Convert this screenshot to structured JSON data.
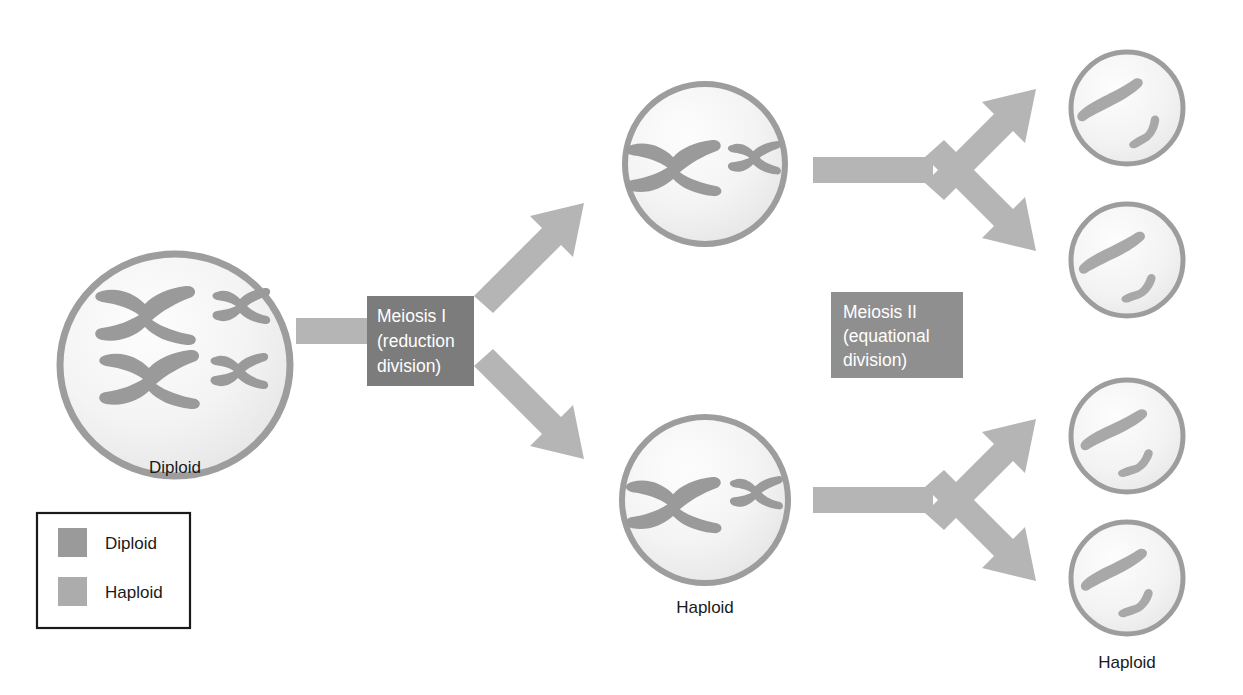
{
  "figure": {
    "background": "#ffffff"
  },
  "colors": {
    "chromosome_diploid": "#9a9a9a",
    "chromosome_haploid": "#a8a8a8",
    "cell_outline": "#9d9d9d",
    "cell_fill_outer": "#ebebeb",
    "cell_fill_inner": "#fdfdfd",
    "arrow": "#b5b5b5",
    "box_meiosis_i": "#7c7c7c",
    "box_meiosis_ii": "#8f8f8f",
    "box_text": "#ffffff",
    "caption_text": "#1a1a1a",
    "legend_border": "#1a1a1a",
    "legend_swatch_diploid": "#9a9a9a",
    "legend_swatch_haploid": "#acacac"
  },
  "stages": {
    "meiosis_i": {
      "line1": "Meiosis I",
      "line2": "(reduction",
      "line3": "division)"
    },
    "meiosis_ii": {
      "line1": "Meiosis II",
      "line2": "(equational",
      "line3": "division)"
    }
  },
  "cells": [
    {
      "id": "parent-cell",
      "caption": "Diploid",
      "ploidy": "diploid",
      "chromosome_count": 4,
      "description": "Two homologous pairs of replicated chromosomes: one large X-shaped pair and one small X-shaped pair"
    },
    {
      "id": "meiosis-i-daughter-top",
      "caption": "",
      "ploidy": "haploid",
      "chromosome_count": 2,
      "description": "One large replicated X chromosome and one small replicated X chromosome"
    },
    {
      "id": "meiosis-i-daughter-bottom",
      "caption": "Haploid",
      "ploidy": "haploid",
      "chromosome_count": 2,
      "description": "One large replicated X chromosome and one small replicated X chromosome"
    },
    {
      "id": "gamete-1",
      "caption": "",
      "ploidy": "haploid",
      "chromosome_count": 2,
      "description": "One large single chromatid and one small single chromatid"
    },
    {
      "id": "gamete-2",
      "caption": "",
      "ploidy": "haploid",
      "chromosome_count": 2,
      "description": "One large single chromatid and one small single chromatid"
    },
    {
      "id": "gamete-3",
      "caption": "",
      "ploidy": "haploid",
      "chromosome_count": 2,
      "description": "One large single chromatid and one small single chromatid"
    },
    {
      "id": "gamete-4",
      "caption": "Haploid",
      "ploidy": "haploid",
      "chromosome_count": 2,
      "description": "One large single chromatid and one small single chromatid"
    }
  ],
  "captions": {
    "parent": "Diploid",
    "meiosis_i_product": "Haploid",
    "gamete": "Haploid"
  },
  "legend": {
    "items": [
      {
        "label": "Diploid",
        "swatch": "#9a9a9a"
      },
      {
        "label": "Haploid",
        "swatch": "#acacac"
      }
    ]
  }
}
